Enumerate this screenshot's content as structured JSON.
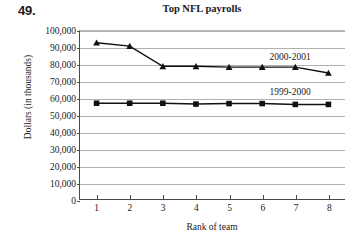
{
  "problem": {
    "number": "49."
  },
  "chart_data": {
    "type": "line",
    "title": "Top NFL payrolls",
    "xlabel": "Rank of team",
    "ylabel": "Dollars (in thousands)",
    "categories": [
      1,
      2,
      3,
      4,
      5,
      6,
      7,
      8
    ],
    "xtick_labels": [
      "1",
      "2",
      "3",
      "4",
      "5",
      "6",
      "7",
      "8"
    ],
    "ytick_labels": [
      "0",
      "10,000",
      "20,000",
      "30,000",
      "40,000",
      "50,000",
      "60,000",
      "70,000",
      "80,000",
      "90,000",
      "100,000"
    ],
    "ytick_values": [
      0,
      10000,
      20000,
      30000,
      40000,
      50000,
      60000,
      70000,
      80000,
      90000,
      100000
    ],
    "ylim": [
      0,
      100000
    ],
    "xlim": [
      0.5,
      8.5
    ],
    "grid": true,
    "legend_position": "inline-right",
    "series": [
      {
        "name": "2000-2001",
        "marker": "triangle",
        "color": "#111111",
        "values": [
          93000,
          91000,
          79000,
          79000,
          78500,
          78500,
          78500,
          75000
        ]
      },
      {
        "name": "1999-2000",
        "marker": "square",
        "color": "#111111",
        "values": [
          57000,
          57000,
          57000,
          56500,
          56800,
          56800,
          56300,
          56300
        ]
      }
    ],
    "annotations": [
      {
        "text": "2000-2001",
        "x": 6.2,
        "y": 84000
      },
      {
        "text": "1999-2000",
        "x": 6.2,
        "y": 63500
      }
    ]
  }
}
